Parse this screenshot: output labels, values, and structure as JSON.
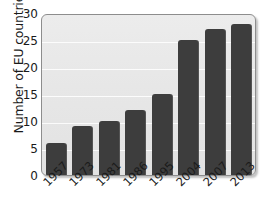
{
  "chart_data": {
    "type": "bar",
    "title": "",
    "subtitle": "",
    "xlabel": "",
    "ylabel": "Number of EU countries",
    "categories": [
      "1957",
      "1973",
      "1981",
      "1986",
      "1995",
      "2004",
      "2007",
      "2013"
    ],
    "values": [
      6,
      9,
      10,
      12,
      15,
      25,
      27,
      28
    ],
    "ylim": [
      0,
      30
    ],
    "yticks": [
      0,
      5,
      10,
      15,
      20,
      25,
      30
    ],
    "grid": true,
    "legend": false,
    "legend_position": "none",
    "xtick_rotation": -45,
    "colors": {
      "bar": "#3d3d3d",
      "panel_background": "#e9e9e9",
      "panel_border": "#8d8d8d",
      "gridline": "#ffffff",
      "text": "#1a1a1a",
      "figure_background": "#ffffff"
    }
  }
}
